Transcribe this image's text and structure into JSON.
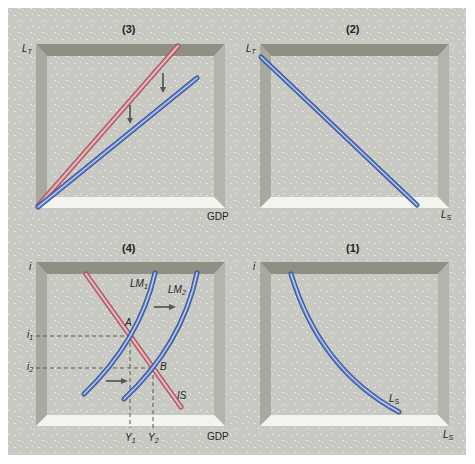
{
  "panels": {
    "p3": {
      "title": "(3)",
      "y_axis": "L",
      "y_axis_sub": "T",
      "x_axis": "GDP"
    },
    "p2": {
      "title": "(2)",
      "y_axis": "L",
      "y_axis_sub": "T",
      "x_axis": "L",
      "x_axis_sub": "S"
    },
    "p4": {
      "title": "(4)",
      "y_axis": "i",
      "x_axis": "GDP",
      "curve_lm1": "LM",
      "curve_lm1_sub": "1",
      "curve_lm2": "LM",
      "curve_lm2_sub": "2",
      "curve_is": "IS",
      "point_a": "A",
      "point_b": "B",
      "i1": "i",
      "i1_sub": "1",
      "i2": "i",
      "i2_sub": "2",
      "y1": "Y",
      "y1_sub": "1",
      "y2": "Y",
      "y2_sub": "2"
    },
    "p1": {
      "title": "(1)",
      "y_axis": "i",
      "x_axis": "L",
      "x_axis_sub": "S",
      "curve": "L",
      "curve_sub": "S"
    }
  },
  "colors": {
    "blue_curve": "#5b79c9",
    "red_curve": "#d97a85",
    "background": "#c9c9c3",
    "frame_dark": "#8e8e82",
    "frame_light": "#f2f2ee",
    "arrow": "#555555"
  }
}
